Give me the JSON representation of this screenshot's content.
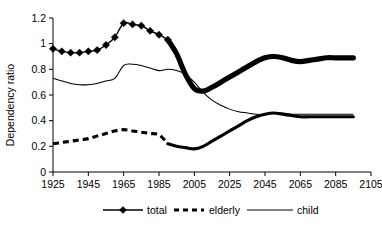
{
  "chart_data": {
    "type": "line",
    "title": "",
    "xlabel": "",
    "ylabel": "Dependency ratio",
    "xlim": [
      1925,
      2105
    ],
    "ylim": [
      0,
      1.2
    ],
    "xticks": [
      1925,
      1945,
      1965,
      1985,
      2005,
      2025,
      2045,
      2065,
      2085,
      2105
    ],
    "yticks": [
      0,
      0.2,
      0.4,
      0.6,
      0.8,
      1,
      1.2
    ],
    "ytick_labels": [
      "0",
      "0.2",
      "0.4",
      "0.6",
      "0.8",
      "1",
      "1.2"
    ],
    "xtick_labels": [
      "1925",
      "1945",
      "1965",
      "1985",
      "2005",
      "2025",
      "2045",
      "2065",
      "2085",
      "2105"
    ],
    "grid": false,
    "legend_position": "bottom",
    "x": [
      1925,
      1930,
      1935,
      1940,
      1945,
      1950,
      1955,
      1960,
      1965,
      1970,
      1975,
      1980,
      1985,
      1990,
      1995,
      2000,
      2005,
      2010,
      2015,
      2020,
      2025,
      2030,
      2035,
      2040,
      2045,
      2050,
      2055,
      2060,
      2065,
      2070,
      2075,
      2080,
      2085,
      2090,
      2095
    ],
    "series": [
      {
        "name": "total",
        "style": "markers-diamond",
        "values": [
          0.96,
          0.94,
          0.93,
          0.93,
          0.94,
          0.95,
          0.99,
          1.05,
          1.16,
          1.15,
          1.14,
          1.1,
          1.07,
          1.03,
          0.92,
          0.76,
          0.65,
          0.63,
          0.66,
          0.7,
          0.74,
          0.78,
          0.82,
          0.86,
          0.89,
          0.9,
          0.89,
          0.87,
          0.86,
          0.87,
          0.88,
          0.89,
          0.89,
          0.89,
          0.89
        ]
      },
      {
        "name": "elderly",
        "style": "dashed-then-solid",
        "values": [
          0.22,
          0.23,
          0.24,
          0.25,
          0.26,
          0.28,
          0.3,
          0.32,
          0.33,
          0.32,
          0.31,
          0.3,
          0.29,
          0.22,
          0.2,
          0.19,
          0.18,
          0.2,
          0.24,
          0.28,
          0.32,
          0.36,
          0.4,
          0.43,
          0.45,
          0.46,
          0.45,
          0.44,
          0.43,
          0.43,
          0.43,
          0.43,
          0.43,
          0.43,
          0.43
        ]
      },
      {
        "name": "child",
        "style": "thin-solid",
        "values": [
          0.73,
          0.71,
          0.69,
          0.68,
          0.68,
          0.69,
          0.71,
          0.73,
          0.83,
          0.84,
          0.83,
          0.81,
          0.79,
          0.8,
          0.79,
          0.76,
          0.7,
          0.62,
          0.56,
          0.52,
          0.49,
          0.47,
          0.46,
          0.45,
          0.45,
          0.46,
          0.46,
          0.45,
          0.45,
          0.45,
          0.45,
          0.45,
          0.45,
          0.45,
          0.45
        ]
      }
    ],
    "elderly_history_end_year": 1990,
    "total_marker_end_year": 1990
  },
  "legend": {
    "items": [
      {
        "label": "total",
        "marker": "diamond-line"
      },
      {
        "label": "elderly",
        "marker": "dashed-line"
      },
      {
        "label": "child",
        "marker": "thin-line"
      }
    ]
  },
  "axis": {
    "y_title": "Dependency ratio"
  }
}
